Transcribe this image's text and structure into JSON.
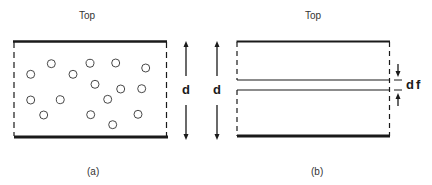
{
  "panel_a": {
    "top_label": "Top",
    "caption": "(a)",
    "dimension_label": "d",
    "particles": [
      [
        30.7,
        74.3
      ],
      [
        51.3,
        63.7
      ],
      [
        73,
        74.3
      ],
      [
        90,
        63.3
      ],
      [
        115.7,
        63
      ],
      [
        145.7,
        68
      ],
      [
        95,
        84.3
      ],
      [
        120.7,
        89
      ],
      [
        141.7,
        88.7
      ],
      [
        30.7,
        100
      ],
      [
        60.3,
        99.7
      ],
      [
        107.7,
        99.3
      ],
      [
        43.7,
        115
      ],
      [
        90.7,
        114.7
      ],
      [
        138,
        114.3
      ],
      [
        112.7,
        124.7
      ]
    ]
  },
  "panel_b": {
    "top_label": "Top",
    "caption": "(b)",
    "dimension_label": "d",
    "film_label": "df"
  },
  "colors": {
    "line": "#1a1a1a",
    "background": "#ffffff"
  }
}
